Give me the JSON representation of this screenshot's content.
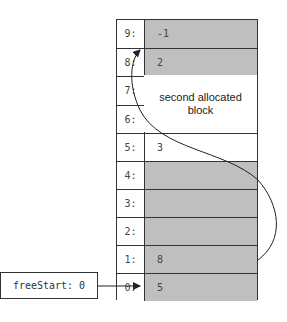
{
  "memory": {
    "rows": [
      {
        "index": "9:",
        "value": "-1",
        "state": "free"
      },
      {
        "index": "8:",
        "value": "2",
        "state": "free"
      },
      {
        "index": "7:",
        "value": "",
        "state": "allocated"
      },
      {
        "index": "6:",
        "value": "",
        "state": "allocated"
      },
      {
        "index": "5:",
        "value": "3",
        "state": "allocated"
      },
      {
        "index": "4:",
        "value": "",
        "state": "free"
      },
      {
        "index": "3:",
        "value": "",
        "state": "free"
      },
      {
        "index": "2:",
        "value": "",
        "state": "free"
      },
      {
        "index": "1:",
        "value": "8",
        "state": "free"
      },
      {
        "index": "0:",
        "value": "5",
        "state": "free"
      }
    ],
    "block_label_line1": "second allocated",
    "block_label_line2": "block"
  },
  "pointer": {
    "label": "freeStart: 0"
  },
  "colors": {
    "free": "#bfbfbf",
    "allocated": "#ffffff",
    "line": "#333333"
  }
}
